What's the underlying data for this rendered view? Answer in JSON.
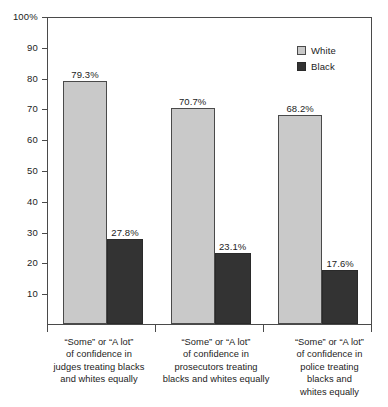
{
  "chart_data": {
    "type": "bar",
    "title": "",
    "subtitle": "",
    "xlabel": "",
    "ylabel": "",
    "ylim": [
      0,
      100
    ],
    "grid": false,
    "legend_position": "top-right",
    "y_ticks": [
      "100%",
      "90",
      "80",
      "70",
      "60",
      "50",
      "40",
      "30",
      "20",
      "10"
    ],
    "y_tick_values": [
      100,
      90,
      80,
      70,
      60,
      50,
      40,
      30,
      20,
      10
    ],
    "categories": [
      "“Some” or “A lot” of confidence in judges treating blacks and whites equally",
      "“Some” or “A lot” of confidence in prosecutors treating blacks and whites equally",
      "“Some” or “A lot” of confidence in police treating blacks and whites equally"
    ],
    "category_label_lines": [
      [
        "“Some” or “A lot”",
        "of confidence in",
        "judges treating blacks",
        "and whites equally"
      ],
      [
        "“Some” or “A lot”",
        "of confidence in",
        "prosecutors treating",
        "blacks and whites equally"
      ],
      [
        "“Some” or “A lot”",
        "of confidence in",
        "police treating",
        "blacks and",
        "whites equally"
      ]
    ],
    "series": [
      {
        "name": "White",
        "color": "#c9c9c9",
        "values": [
          79.3,
          70.7,
          68.2
        ],
        "labels": [
          "79.3%",
          "70.7%",
          "68.2%"
        ]
      },
      {
        "name": "Black",
        "color": "#333333",
        "values": [
          27.8,
          23.1,
          17.6
        ],
        "labels": [
          "27.8%",
          "23.1%",
          "17.6%"
        ]
      }
    ]
  },
  "legend": {
    "items": [
      {
        "label": "White",
        "color": "#c9c9c9"
      },
      {
        "label": "Black",
        "color": "#333333"
      }
    ]
  }
}
